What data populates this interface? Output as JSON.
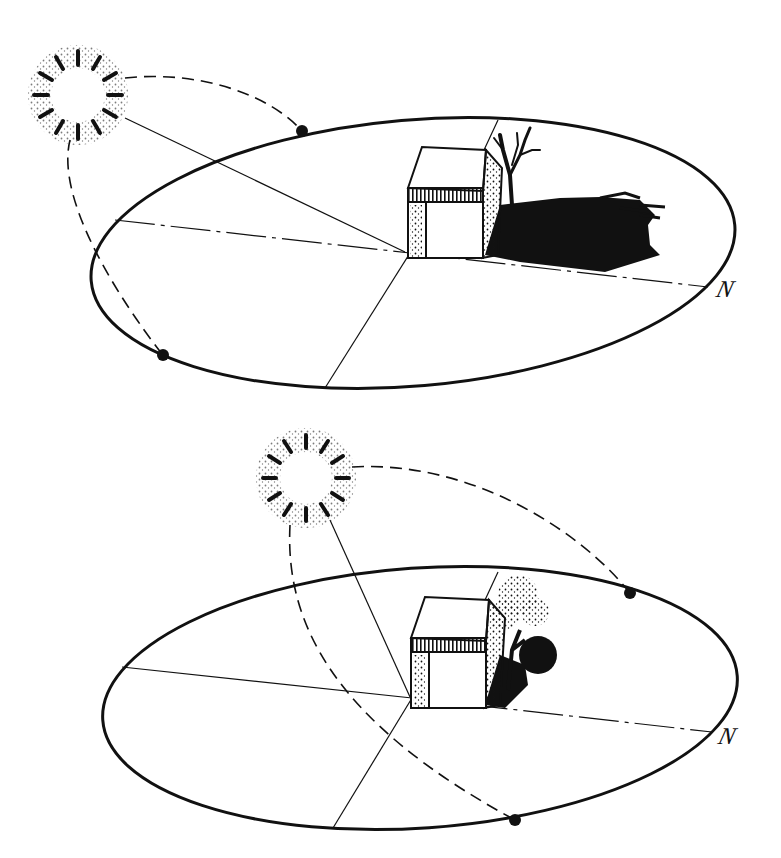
{
  "figure": {
    "colors": {
      "ink": "#111111",
      "background": "#ffffff"
    }
  },
  "panels": [
    {
      "id": "winter",
      "north_label": "N",
      "sun_icon": "sun-icon",
      "tree": "bare-tree",
      "shadow": "long-shadow"
    },
    {
      "id": "summer",
      "north_label": "N",
      "sun_icon": "sun-icon",
      "tree": "leafy-tree",
      "shadow": "short-shadow"
    }
  ]
}
